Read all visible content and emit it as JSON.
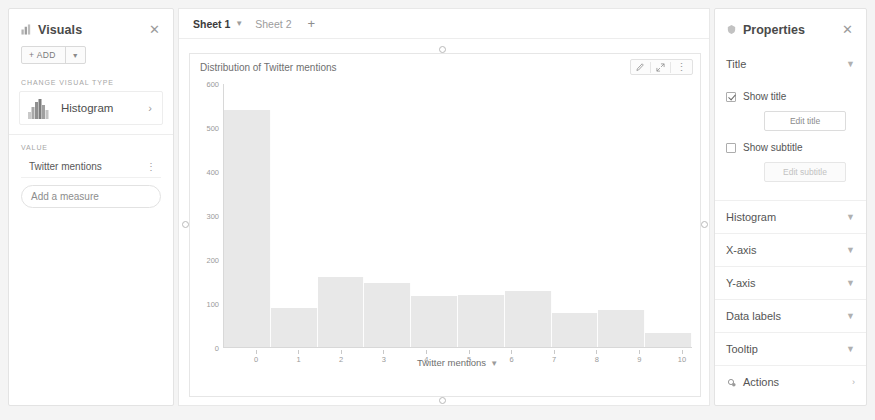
{
  "left_panel": {
    "title": "Visuals",
    "icon": "visuals-icon",
    "close_icon": "close-icon",
    "add_button": "+ ADD",
    "add_caret_icon": "chevron-down-icon",
    "change_visual_type_label": "CHANGE VISUAL TYPE",
    "visual_type": {
      "name": "Histogram",
      "thumb_icon": "histogram-thumbnail-icon",
      "chevron_icon": "chevron-right-icon"
    },
    "value_label": "VALUE",
    "fields": [
      {
        "name": "Twitter mentions",
        "kebab_icon": "kebab-menu-icon"
      }
    ],
    "add_measure_placeholder": "Add a measure"
  },
  "sheets": {
    "tabs": [
      {
        "label": "Sheet 1",
        "active": true,
        "chevron_icon": "chevron-down-icon"
      },
      {
        "label": "Sheet 2",
        "active": false
      }
    ],
    "add_tab_icon": "plus-icon"
  },
  "visual": {
    "title": "Distribution of Twitter mentions",
    "tools": [
      {
        "name": "edit-pencil-icon"
      },
      {
        "name": "maximize-icon"
      },
      {
        "name": "kebab-menu-icon"
      }
    ]
  },
  "chart_data": {
    "type": "bar",
    "title": "Distribution of Twitter mentions",
    "xlabel": "Twitter mentions",
    "ylabel": "",
    "xlim": [
      0,
      10
    ],
    "ylim": [
      0,
      600
    ],
    "xticks": [
      0,
      1,
      2,
      3,
      4,
      5,
      6,
      7,
      8,
      9,
      10
    ],
    "yticks": [
      0,
      100,
      200,
      300,
      400,
      500,
      600
    ],
    "grid": false,
    "bin_edges": [
      0,
      1,
      2,
      3,
      4,
      5,
      6,
      7,
      8,
      9,
      10
    ],
    "categories": [
      "0-1",
      "1-2",
      "2-3",
      "3-4",
      "4-5",
      "5-6",
      "6-7",
      "7-8",
      "8-9",
      "9-10"
    ],
    "values": [
      540,
      90,
      160,
      147,
      117,
      118,
      127,
      78,
      85,
      32
    ],
    "bar_color": "#e8e8e8"
  },
  "axis_title": {
    "text": "Twitter mentions",
    "chevron_icon": "chevron-down-icon"
  },
  "right_panel": {
    "title": "Properties",
    "icon": "properties-icon",
    "close_icon": "close-icon",
    "title_section": {
      "label": "Title",
      "chevron_icon": "chevron-up-icon",
      "show_title": {
        "label": "Show title",
        "checked": true
      },
      "edit_title_button": "Edit title",
      "show_subtitle": {
        "label": "Show subtitle",
        "checked": false
      },
      "edit_subtitle_button": "Edit subtitle"
    },
    "sections": [
      {
        "label": "Histogram",
        "chevron_icon": "chevron-down-icon"
      },
      {
        "label": "X-axis",
        "chevron_icon": "chevron-down-icon"
      },
      {
        "label": "Y-axis",
        "chevron_icon": "chevron-down-icon"
      },
      {
        "label": "Data labels",
        "chevron_icon": "chevron-down-icon"
      },
      {
        "label": "Tooltip",
        "chevron_icon": "chevron-down-icon"
      }
    ],
    "actions": {
      "label": "Actions",
      "icon": "actions-icon",
      "chevron_icon": "chevron-right-icon"
    }
  }
}
